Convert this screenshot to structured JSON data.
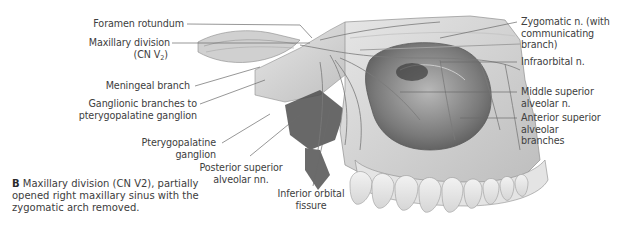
{
  "figure": {
    "caption": {
      "label": "B",
      "text": "Maxillary division (CN V2), partially opened right maxillary sinus with the zygomatic arch removed."
    },
    "labels_left": [
      {
        "id": "foramen-rotundum",
        "text": "Foramen rotundum"
      },
      {
        "id": "maxillary-division",
        "line1": "Maxillary division",
        "line2_prefix": "(CN V",
        "line2_sub": "2",
        "line2_suffix": ")"
      },
      {
        "id": "meningeal-branch",
        "text": "Meningeal branch"
      },
      {
        "id": "ganglionic-branches",
        "line1": "Ganglionic branches to",
        "line2": "pterygopalatine ganglion"
      },
      {
        "id": "pterygopalatine-ganglion",
        "line1": "Pterygopalatine",
        "line2": "ganglion"
      },
      {
        "id": "posterior-superior-alveolar",
        "line1": "Posterior superior",
        "line2": "alveolar nn."
      },
      {
        "id": "inferior-orbital-fissure",
        "line1": "Inferior orbital",
        "line2": "fissure"
      }
    ],
    "labels_right": [
      {
        "id": "zygomatic-n",
        "line1": "Zygomatic n. (with",
        "line2": "communicating",
        "line3": "branch)"
      },
      {
        "id": "infraorbital-n",
        "text": "Infraorbital n."
      },
      {
        "id": "middle-superior-alveolar",
        "line1": "Middle superior",
        "line2": "alveolar n."
      },
      {
        "id": "anterior-superior-alveolar",
        "line1": "Anterior superior",
        "line2": "alveolar",
        "line3": "branches"
      }
    ],
    "colors": {
      "text": "#404040",
      "leader_line": "#6a6a6a",
      "illustration_dark": "#4a4a4a",
      "illustration_mid": "#9a9a9a",
      "illustration_light": "#d8d8d8"
    }
  }
}
